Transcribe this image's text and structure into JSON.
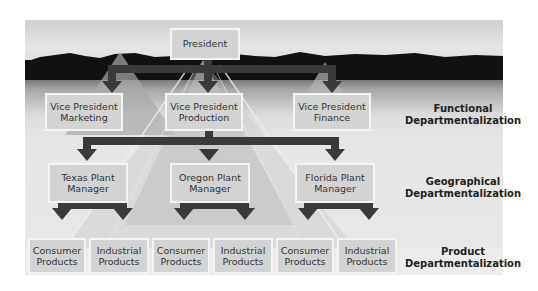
{
  "diagram": {
    "top": {
      "label": "President"
    },
    "functional": [
      {
        "line1": "Vice President",
        "line2": "Marketing"
      },
      {
        "line1": "Vice President",
        "line2": "Production"
      },
      {
        "line1": "Vice President",
        "line2": "Finance"
      }
    ],
    "geographical": [
      {
        "line1": "Texas Plant",
        "line2": "Manager"
      },
      {
        "line1": "Oregon Plant",
        "line2": "Manager"
      },
      {
        "line1": "Florida Plant",
        "line2": "Manager"
      }
    ],
    "product": [
      {
        "line1": "Consumer",
        "line2": "Products"
      },
      {
        "line1": "Industrial",
        "line2": "Products"
      },
      {
        "line1": "Consumer",
        "line2": "Products"
      },
      {
        "line1": "Industrial",
        "line2": "Products"
      },
      {
        "line1": "Consumer",
        "line2": "Products"
      },
      {
        "line1": "Industrial",
        "line2": "Products"
      }
    ],
    "levels": [
      {
        "line1": "Functional",
        "line2": "Departmentalization"
      },
      {
        "line1": "Geographical",
        "line2": "Departmentalization"
      },
      {
        "line1": "Product",
        "line2": "Departmentalization"
      }
    ],
    "colors": {
      "arrow": "#3a3a3a",
      "box": "#d3d3d3",
      "box_border": "#f4f4f4",
      "mountains": "#111111"
    }
  }
}
